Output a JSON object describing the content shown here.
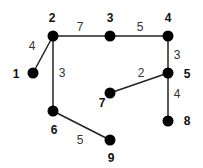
{
  "graph": {
    "type": "weighted-undirected-tree",
    "node_color": "#000000",
    "edge_color": "#222222",
    "nodes": [
      {
        "id": "1",
        "label": "1",
        "x": 33,
        "y": 73,
        "lx": 16,
        "ly": 78
      },
      {
        "id": "2",
        "label": "2",
        "x": 53,
        "y": 36,
        "lx": 52,
        "ly": 22
      },
      {
        "id": "3",
        "label": "3",
        "x": 110,
        "y": 36,
        "lx": 110,
        "ly": 22
      },
      {
        "id": "4",
        "label": "4",
        "x": 168,
        "y": 36,
        "lx": 168,
        "ly": 22
      },
      {
        "id": "5",
        "label": "5",
        "x": 168,
        "y": 73,
        "lx": 187,
        "ly": 78
      },
      {
        "id": "6",
        "label": "6",
        "x": 53,
        "y": 111,
        "lx": 54,
        "ly": 134
      },
      {
        "id": "7",
        "label": "7",
        "x": 110,
        "y": 93,
        "lx": 102,
        "ly": 107
      },
      {
        "id": "8",
        "label": "8",
        "x": 168,
        "y": 121,
        "lx": 187,
        "ly": 125
      },
      {
        "id": "9",
        "label": "9",
        "x": 110,
        "y": 140,
        "lx": 111,
        "ly": 162
      }
    ],
    "edges": [
      {
        "from": "1",
        "to": "2",
        "weight": "4",
        "wx": 32,
        "wy": 50
      },
      {
        "from": "2",
        "to": "3",
        "weight": "7",
        "wx": 80,
        "wy": 31
      },
      {
        "from": "3",
        "to": "4",
        "weight": "5",
        "wx": 140,
        "wy": 31
      },
      {
        "from": "4",
        "to": "5",
        "weight": "3",
        "wx": 177,
        "wy": 59
      },
      {
        "from": "2",
        "to": "6",
        "weight": "3",
        "wx": 62,
        "wy": 77
      },
      {
        "from": "5",
        "to": "7",
        "weight": "2",
        "wx": 141,
        "wy": 77
      },
      {
        "from": "5",
        "to": "8",
        "weight": "4",
        "wx": 177,
        "wy": 98
      },
      {
        "from": "6",
        "to": "9",
        "weight": "5",
        "wx": 80,
        "wy": 144
      }
    ]
  }
}
